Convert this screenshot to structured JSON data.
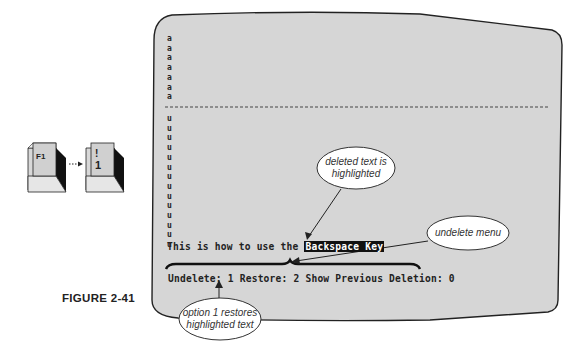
{
  "figure": {
    "label": "FIGURE 2-41"
  },
  "keys": {
    "first": {
      "label": "F1"
    },
    "second": {
      "top": "!",
      "bottom": "1"
    }
  },
  "screen": {
    "a_lines": [
      "a",
      "a",
      "a",
      "a",
      "a",
      "a",
      "a"
    ],
    "u_lines": [
      "u",
      "u",
      "u",
      "u",
      "u",
      "u",
      "u",
      "u",
      "u",
      "u",
      "u",
      "u",
      "u",
      "u"
    ],
    "text_line": {
      "prefix": "This is how to use the ",
      "highlighted": "Backspace Key"
    },
    "menu_line": "Undelete: 1 Restore: 2 Show Previous Deletion: 0"
  },
  "callouts": {
    "deleted": "deleted text is highlighted",
    "undelete_menu": "undelete menu",
    "option1": "option 1 restores highlighted text"
  },
  "colors": {
    "screen_bg": "#d6d6d6",
    "outline": "#222222",
    "highlight_bg": "#111111"
  }
}
